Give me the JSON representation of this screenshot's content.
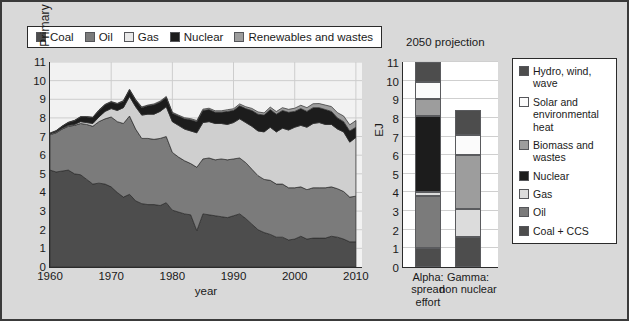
{
  "colors": {
    "coal": "#4d4d4d",
    "oil": "#7b7b7b",
    "gas": "#cfcfcf",
    "nuclear": "#1c1c1c",
    "renewables": "#9d9d9d",
    "hydro": "#4d4d4d",
    "solar": "#fbfbfb",
    "biomass": "#9d9d9d",
    "coal_ccs": "#4d4d4d",
    "background": "#d9d9d9",
    "plot_bg": "#f2f2f2",
    "axis": "#2b2b2b"
  },
  "left_legend": {
    "items": [
      {
        "label": "Coal",
        "color": "#4d4d4d"
      },
      {
        "label": "Oil",
        "color": "#7b7b7b"
      },
      {
        "label": "Gas",
        "color": "#e8e8e8"
      },
      {
        "label": "Nuclear",
        "color": "#1c1c1c"
      },
      {
        "label": "Renewables and wastes",
        "color": "#9d9d9d"
      }
    ]
  },
  "right_legend": {
    "items": [
      {
        "label": "Hydro, wind, wave",
        "color": "#4d4d4d"
      },
      {
        "label": "Solar and environmental heat",
        "color": "#fbfbfb"
      },
      {
        "label": "Biomass and wastes",
        "color": "#9d9d9d"
      },
      {
        "label": "Nuclear",
        "color": "#1c1c1c"
      },
      {
        "label": "Gas",
        "color": "#dcdcdc"
      },
      {
        "label": "Oil",
        "color": "#7b7b7b"
      },
      {
        "label": "Coal + CCS",
        "color": "#4d4d4d"
      }
    ]
  },
  "right_panel": {
    "title": "2050 projection",
    "ylabel": "EJ",
    "bar_labels": [
      "Alpha: spread effort",
      "Gamma: non nuclear"
    ]
  },
  "chart_data": [
    {
      "type": "area",
      "id": "uk-primary-energy-history",
      "title": "",
      "xlabel": "year",
      "ylabel": "Primary Energy/EJ",
      "xlim": [
        1960,
        2011
      ],
      "ylim": [
        0,
        11
      ],
      "yticks": [
        0,
        1,
        2,
        3,
        4,
        5,
        6,
        7,
        8,
        9,
        10,
        11
      ],
      "xticks": [
        1960,
        1970,
        1980,
        1990,
        2000,
        2010
      ],
      "grid": true,
      "legend_position": "top",
      "stacked": true,
      "x": [
        1960,
        1961,
        1962,
        1963,
        1964,
        1965,
        1966,
        1967,
        1968,
        1969,
        1970,
        1971,
        1972,
        1973,
        1974,
        1975,
        1976,
        1977,
        1978,
        1979,
        1980,
        1981,
        1982,
        1983,
        1984,
        1985,
        1986,
        1987,
        1988,
        1989,
        1990,
        1991,
        1992,
        1993,
        1994,
        1995,
        1996,
        1997,
        1998,
        1999,
        2000,
        2001,
        2002,
        2003,
        2004,
        2005,
        2006,
        2007,
        2008,
        2009,
        2010
      ],
      "series": [
        {
          "name": "Coal",
          "color": "#4d4d4d",
          "values": [
            5.2,
            5.1,
            5.15,
            5.2,
            5.0,
            4.95,
            4.7,
            4.45,
            4.5,
            4.45,
            4.3,
            4.0,
            3.75,
            3.9,
            3.55,
            3.4,
            3.35,
            3.35,
            3.3,
            3.45,
            3.05,
            2.95,
            2.85,
            2.8,
            1.95,
            2.85,
            2.8,
            2.75,
            2.7,
            2.65,
            2.75,
            2.85,
            2.6,
            2.3,
            2.0,
            1.85,
            1.75,
            1.6,
            1.6,
            1.45,
            1.5,
            1.65,
            1.5,
            1.55,
            1.55,
            1.55,
            1.65,
            1.6,
            1.5,
            1.35,
            1.35
          ]
        },
        {
          "name": "Oil",
          "color": "#7b7b7b",
          "values": [
            1.9,
            2.1,
            2.25,
            2.35,
            2.6,
            2.75,
            2.95,
            3.1,
            3.3,
            3.5,
            3.75,
            3.8,
            3.95,
            4.2,
            3.85,
            3.5,
            3.55,
            3.5,
            3.6,
            3.55,
            3.1,
            2.95,
            2.85,
            2.75,
            3.4,
            2.95,
            3.05,
            3.0,
            3.1,
            3.1,
            3.05,
            3.0,
            3.0,
            2.95,
            2.9,
            2.85,
            2.9,
            2.85,
            2.85,
            2.8,
            2.75,
            2.65,
            2.65,
            2.7,
            2.7,
            2.7,
            2.65,
            2.6,
            2.55,
            2.4,
            2.45
          ]
        },
        {
          "name": "Gas",
          "color": "#cfcfcf",
          "values": [
            0.05,
            0.05,
            0.05,
            0.05,
            0.05,
            0.1,
            0.1,
            0.15,
            0.25,
            0.4,
            0.45,
            0.6,
            0.85,
            1.05,
            1.2,
            1.25,
            1.3,
            1.35,
            1.45,
            1.6,
            1.65,
            1.7,
            1.7,
            1.75,
            1.85,
            1.95,
            1.95,
            1.95,
            1.9,
            1.9,
            1.95,
            2.1,
            2.15,
            2.3,
            2.4,
            2.55,
            2.85,
            2.8,
            3.0,
            3.1,
            3.25,
            3.3,
            3.35,
            3.45,
            3.5,
            3.4,
            3.35,
            3.2,
            3.2,
            2.95,
            3.15
          ]
        },
        {
          "name": "Nuclear",
          "color": "#1c1c1c",
          "values": [
            0.02,
            0.05,
            0.1,
            0.15,
            0.2,
            0.25,
            0.3,
            0.32,
            0.35,
            0.35,
            0.35,
            0.35,
            0.35,
            0.35,
            0.35,
            0.4,
            0.45,
            0.5,
            0.5,
            0.5,
            0.45,
            0.5,
            0.55,
            0.6,
            0.6,
            0.65,
            0.65,
            0.6,
            0.6,
            0.7,
            0.65,
            0.7,
            0.75,
            0.85,
            0.9,
            0.9,
            0.95,
            0.95,
            0.95,
            0.95,
            0.85,
            0.9,
            0.85,
            0.85,
            0.8,
            0.8,
            0.7,
            0.6,
            0.55,
            0.6,
            0.55
          ]
        },
        {
          "name": "Renewables and wastes",
          "color": "#9d9d9d",
          "values": [
            0.02,
            0.02,
            0.02,
            0.02,
            0.02,
            0.02,
            0.02,
            0.02,
            0.03,
            0.03,
            0.03,
            0.03,
            0.03,
            0.04,
            0.04,
            0.04,
            0.04,
            0.05,
            0.05,
            0.05,
            0.05,
            0.05,
            0.06,
            0.06,
            0.06,
            0.07,
            0.07,
            0.08,
            0.08,
            0.09,
            0.09,
            0.1,
            0.1,
            0.11,
            0.12,
            0.12,
            0.13,
            0.14,
            0.15,
            0.16,
            0.17,
            0.18,
            0.2,
            0.21,
            0.22,
            0.24,
            0.26,
            0.28,
            0.3,
            0.33,
            0.36
          ]
        }
      ]
    },
    {
      "type": "bar",
      "id": "2050-projection",
      "title": "2050 projection",
      "xlabel": "",
      "ylabel": "EJ",
      "ylim": [
        0,
        11
      ],
      "yticks": [
        0,
        1,
        2,
        3,
        4,
        5,
        6,
        7,
        8,
        9,
        10,
        11
      ],
      "grid": true,
      "stacked": true,
      "categories": [
        "Alpha: spread effort",
        "Gamma: non nuclear"
      ],
      "series": [
        {
          "name": "Coal + CCS",
          "color": "#4d4d4d",
          "values": [
            1.0,
            1.6
          ]
        },
        {
          "name": "Oil",
          "color": "#7b7b7b",
          "values": [
            2.8,
            0.0
          ]
        },
        {
          "name": "Gas",
          "color": "#dcdcdc",
          "values": [
            0.25,
            1.5
          ]
        },
        {
          "name": "Nuclear",
          "color": "#1c1c1c",
          "values": [
            4.05,
            0.0
          ]
        },
        {
          "name": "Biomass and wastes",
          "color": "#9d9d9d",
          "values": [
            0.9,
            2.9
          ]
        },
        {
          "name": "Solar and environmental heat",
          "color": "#fbfbfb",
          "values": [
            0.95,
            1.1
          ]
        },
        {
          "name": "Hydro, wind, wave",
          "color": "#4d4d4d",
          "values": [
            1.05,
            1.3
          ]
        }
      ],
      "totals": [
        11.0,
        8.4
      ]
    }
  ]
}
